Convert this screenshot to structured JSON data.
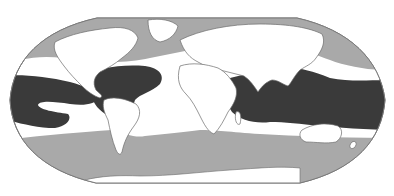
{
  "map": {
    "projection": "Robinson",
    "colors": {
      "background": "#ffffff",
      "ocean_unshaded": "#ffffff",
      "land": "#ffffff",
      "coastline": "#6b6b6b",
      "zone_dark": "#3a3a3a",
      "zone_light": "#a9a9a9",
      "globe_outline": "#7a7a7a"
    },
    "zones": [
      {
        "id": "tropical-warm-belt",
        "shade": "dark",
        "regions": [
          "Caribbean / Gulf of Mexico",
          "Tropical Atlantic",
          "Eastern Tropical Pacific",
          "Indian Ocean",
          "Indo-Pacific / Western Pacific"
        ]
      },
      {
        "id": "north-polar-band",
        "shade": "light",
        "regions": [
          "Arctic / North Atlantic",
          "North Pacific"
        ]
      },
      {
        "id": "south-circumpolar-band",
        "shade": "light",
        "regions": [
          "Southern Ocean"
        ]
      }
    ]
  }
}
